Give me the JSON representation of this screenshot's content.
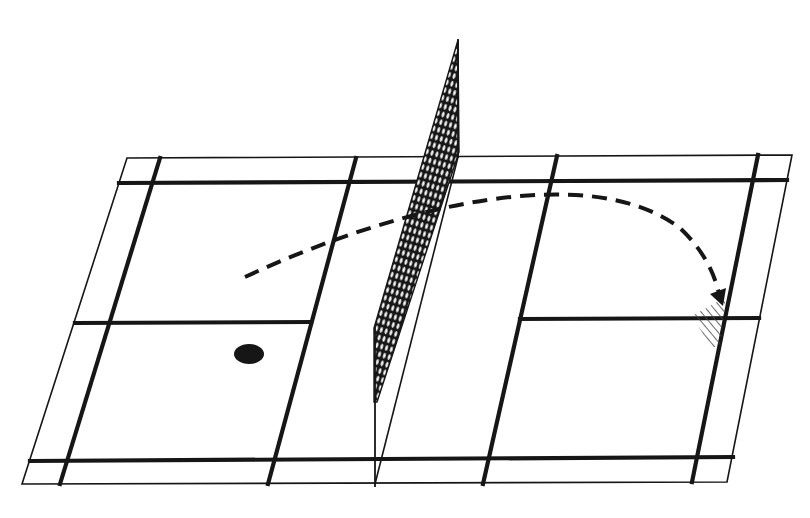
{
  "diagram": {
    "kind": "badminton court perspective diagram",
    "width": 810,
    "height": 518,
    "colors": {
      "background": "#ffffff",
      "ink": "#161616",
      "mesh_hole": "#ffffff",
      "hatch": "#444444"
    },
    "court": {
      "outer_boundary": [
        [
          127,
          158
        ],
        [
          792,
          155
        ],
        [
          727,
          482
        ],
        [
          22,
          484
        ]
      ],
      "outer_stroke": 1.6,
      "thick_stroke": 4.2,
      "thick_lines": [
        {
          "name": "far-doubles-service-line",
          "from": [
            119,
            183
          ],
          "to": [
            787,
            180
          ]
        },
        {
          "name": "near-doubles-service-line",
          "from": [
            30,
            461
          ],
          "to": [
            733,
            457
          ]
        },
        {
          "name": "left-singles-sideline",
          "from": [
            160,
            158
          ],
          "to": [
            60,
            484
          ]
        },
        {
          "name": "right-singles-sideline",
          "from": [
            758,
            155
          ],
          "to": [
            692,
            482
          ]
        },
        {
          "name": "left-short-service-line",
          "from": [
            356,
            158
          ],
          "to": [
            268,
            484
          ]
        },
        {
          "name": "right-short-service-line",
          "from": [
            557,
            156
          ],
          "to": [
            483,
            484
          ]
        },
        {
          "name": "left-center-line",
          "from": [
            75,
            323
          ],
          "to": [
            311,
            322
          ]
        },
        {
          "name": "right-center-line",
          "from": [
            520,
            319
          ],
          "to": [
            759,
            318
          ]
        }
      ],
      "net_line": {
        "from": [
          458,
          157
        ],
        "to": [
          375,
          484
        ]
      }
    },
    "net": {
      "far_post": {
        "from": [
          458,
          40
        ],
        "to": [
          458,
          157
        ]
      },
      "near_post": {
        "from": [
          375,
          327
        ],
        "to": [
          375,
          486
        ]
      },
      "mesh_polygon": [
        [
          458,
          40
        ],
        [
          459,
          152
        ],
        [
          377,
          402
        ],
        [
          374,
          402
        ],
        [
          374,
          328
        ]
      ],
      "mesh_angle": 16
    },
    "shuttle_position": {
      "cx": 249,
      "cy": 354,
      "rx": 15,
      "ry": 10
    },
    "trajectory": {
      "path": "M245,277 C 400,205 590,160 680,228 Q 712,258 720,298",
      "stroke": 4,
      "dash": "15 9",
      "arrowhead": [
        [
          710,
          294
        ],
        [
          726,
          288
        ],
        [
          723,
          306
        ]
      ]
    },
    "landing_zone": {
      "polygon": [
        [
          726,
          297
        ],
        [
          692,
          316
        ],
        [
          711,
          347
        ],
        [
          720,
          347
        ]
      ],
      "hatch_spacing": 6
    }
  }
}
